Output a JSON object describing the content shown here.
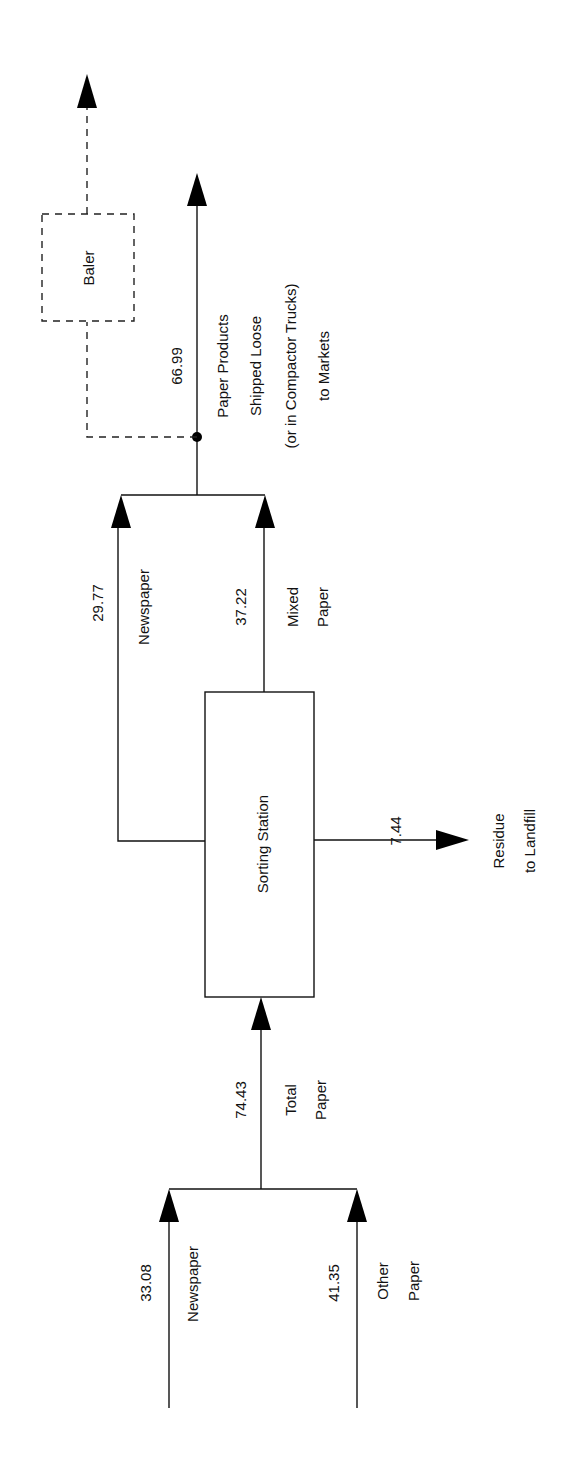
{
  "diagram": {
    "type": "process-flow",
    "orientation": "rotated-90-ccw",
    "colors": {
      "ink": "#111111",
      "background": "#ffffff"
    },
    "nodes": {
      "sorting_station": {
        "label": "Sorting Station"
      },
      "baler": {
        "label": "Baler",
        "style": "dashed"
      }
    },
    "inputs": [
      {
        "id": "newspaper_in",
        "value": "33.08",
        "label": "Newspaper"
      },
      {
        "id": "other_paper_in",
        "value": "41.35",
        "label_line1": "Other",
        "label_line2": "Paper"
      }
    ],
    "total_input": {
      "value": "74.43",
      "label_line1": "Total",
      "label_line2": "Paper"
    },
    "outputs": {
      "newspaper": {
        "value": "29.77",
        "label": "Newspaper"
      },
      "mixed_paper": {
        "value": "37.22",
        "label_line1": "Mixed",
        "label_line2": "Paper"
      },
      "residue": {
        "value": "7.44",
        "label_line1": "Residue",
        "label_line2": "to Landfill"
      },
      "products": {
        "value": "66.99",
        "label_line1": "Paper Products",
        "label_line2": "Shipped Loose",
        "label_line3": "(or in Compactor Trucks)",
        "label_line4": "to Markets"
      }
    }
  }
}
